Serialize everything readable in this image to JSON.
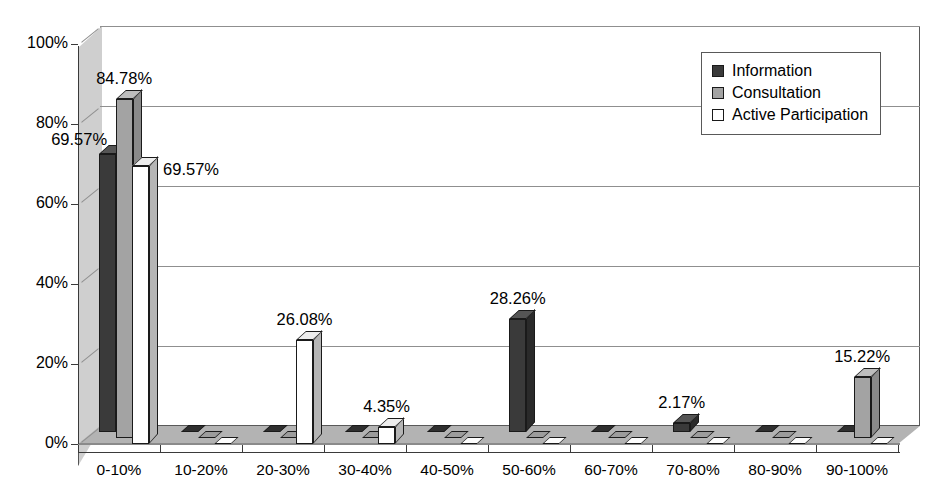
{
  "chart_data": {
    "type": "bar",
    "title": "",
    "subtitle": "",
    "xlabel": "",
    "ylabel": "",
    "ylim": [
      0,
      100
    ],
    "grid": true,
    "legend_position": "top-right",
    "three_d": true,
    "categories": [
      "0-10%",
      "10-20%",
      "20-30%",
      "30-40%",
      "40-50%",
      "50-60%",
      "60-70%",
      "70-80%",
      "80-90%",
      "90-100%"
    ],
    "y_ticks": [
      "0%",
      "20%",
      "40%",
      "60%",
      "80%",
      "100%"
    ],
    "y_tick_values": [
      0,
      20,
      40,
      60,
      80,
      100
    ],
    "series": [
      {
        "name": "Information",
        "color": "#3a3a3a",
        "values": [
          69.57,
          0,
          0,
          0,
          0,
          28.26,
          0,
          2.17,
          0,
          0
        ],
        "labels": [
          "69.57%",
          "",
          "",
          "",
          "",
          "28.26%",
          "",
          "2.17%",
          "",
          ""
        ]
      },
      {
        "name": "Consultation",
        "color": "#a3a3a3",
        "values": [
          84.78,
          0,
          0,
          0,
          0,
          0,
          0,
          0,
          0,
          15.22
        ],
        "labels": [
          "84.78%",
          "",
          "",
          "",
          "",
          "",
          "",
          "",
          "",
          "15.22%"
        ]
      },
      {
        "name": "Active Participation",
        "color": "#ffffff",
        "values": [
          69.57,
          0,
          26.08,
          4.35,
          0,
          0,
          0,
          0,
          0,
          0
        ],
        "labels": [
          "69.57%",
          "",
          "26.08%",
          "4.35%",
          "",
          "",
          "",
          "",
          "",
          ""
        ]
      }
    ]
  },
  "legend": {
    "items": [
      {
        "label": "Information",
        "key": "v-info"
      },
      {
        "label": "Consultation",
        "key": "v-cons"
      },
      {
        "label": "Active Participation",
        "key": "v-act"
      }
    ]
  }
}
